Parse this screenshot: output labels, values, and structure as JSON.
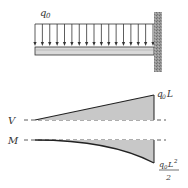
{
  "diagram": {
    "load": {
      "label": "q",
      "subscript": "0",
      "arrow_count": 17
    },
    "shear": {
      "axis_label": "V",
      "end_label": "q",
      "end_label_sub": "0",
      "end_label_tail": "L"
    },
    "moment": {
      "axis_label": "M",
      "end_label_num": "q",
      "end_label_num_sub": "0",
      "end_label_num_tail": "L",
      "end_label_num_sup": "2",
      "end_label_den": "2"
    },
    "colors": {
      "line": "#222222",
      "fill": "#c8c8c8",
      "beam": "#d9d9d9",
      "wall": "#8a8a8a"
    }
  }
}
